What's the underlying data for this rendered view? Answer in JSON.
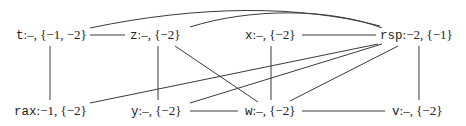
{
  "graph": {
    "nodes": [
      {
        "id": "t",
        "var": "t",
        "label": ":–, {−1, −2}"
      },
      {
        "id": "z",
        "var": "z",
        "label": ":–, {−2}"
      },
      {
        "id": "x",
        "var": "x",
        "label": ":–, {−2}"
      },
      {
        "id": "rsp",
        "var": "rsp",
        "label": ":−2, {−1}"
      },
      {
        "id": "rax",
        "var": "rax",
        "label": ":−1, {−2}"
      },
      {
        "id": "y",
        "var": "y",
        "label": ":–, {−2}"
      },
      {
        "id": "w",
        "var": "w",
        "label": ":–, {−2}"
      },
      {
        "id": "v",
        "var": "v",
        "label": ":–, {−2}"
      }
    ],
    "edges": [
      [
        "t",
        "z"
      ],
      [
        "t",
        "rax"
      ],
      [
        "t",
        "rsp"
      ],
      [
        "z",
        "rsp"
      ],
      [
        "z",
        "y"
      ],
      [
        "z",
        "w"
      ],
      [
        "x",
        "rsp"
      ],
      [
        "x",
        "w"
      ],
      [
        "rsp",
        "rax"
      ],
      [
        "rsp",
        "y"
      ],
      [
        "rsp",
        "w"
      ],
      [
        "rsp",
        "v"
      ],
      [
        "y",
        "w"
      ],
      [
        "w",
        "v"
      ]
    ]
  }
}
